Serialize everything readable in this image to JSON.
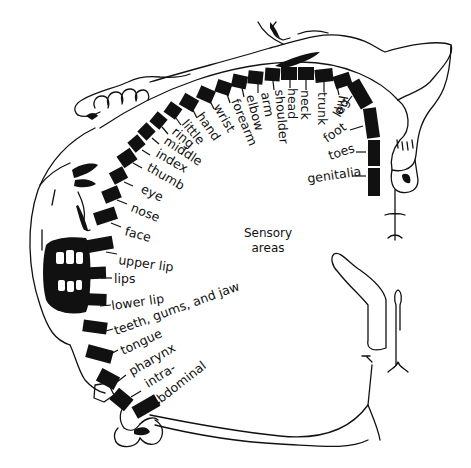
{
  "colors": {
    "ink": "#111111",
    "paper": "#ffffff"
  },
  "center_label": {
    "line1": "Sensory",
    "line2": "areas"
  },
  "regions": [
    {
      "label": "genitalia",
      "seg": [
        368,
        168,
        12,
        28,
        0
      ],
      "tick": [
        352,
        176,
        366,
        176
      ],
      "text": [
        308,
        183,
        -8
      ]
    },
    {
      "label": "toes",
      "seg": [
        368,
        140,
        12,
        26,
        0
      ],
      "tick": [
        356,
        152,
        366,
        152
      ],
      "text": [
        330,
        160,
        -18
      ]
    },
    {
      "label": "foot",
      "seg": [
        365,
        108,
        13,
        30,
        -8
      ],
      "tick": [
        350,
        130,
        363,
        126
      ],
      "text": [
        327,
        143,
        -35
      ]
    },
    {
      "label": "leg",
      "seg": [
        353,
        80,
        14,
        28,
        -30
      ],
      "tick": [
        346,
        104,
        352,
        96
      ],
      "text": [
        340,
        118,
        -60
      ]
    },
    {
      "label": "hip",
      "seg": [
        334,
        74,
        17,
        13,
        -18
      ],
      "tick": [
        337,
        86,
        339,
        95
      ],
      "text": [
        339,
        95,
        100
      ]
    },
    {
      "label": "trunk",
      "seg": [
        315,
        69,
        18,
        13,
        -6
      ],
      "tick": [
        324,
        82,
        324,
        92
      ],
      "text": [
        318,
        92,
        90
      ]
    },
    {
      "label": "neck",
      "seg": [
        298,
        67,
        16,
        13,
        0
      ],
      "tick": [
        306,
        80,
        306,
        90
      ],
      "text": [
        301,
        90,
        90
      ]
    },
    {
      "label": "head",
      "seg": [
        281,
        67,
        16,
        13,
        0
      ],
      "tick": [
        290,
        80,
        290,
        88
      ],
      "text": [
        288,
        88,
        90
      ]
    },
    {
      "label": "shoulder",
      "seg": [
        265,
        68,
        15,
        13,
        4
      ],
      "tick": [
        273,
        81,
        274,
        90
      ],
      "text": [
        275,
        90,
        85
      ]
    },
    {
      "label": "arm",
      "seg": [
        248,
        71,
        15,
        13,
        6
      ],
      "tick": [
        258,
        84,
        258,
        93
      ],
      "text": [
        261,
        93,
        80
      ]
    },
    {
      "label": "elbow",
      "seg": [
        232,
        75,
        15,
        13,
        12
      ],
      "tick": [
        242,
        88,
        244,
        97
      ],
      "text": [
        246,
        96,
        75
      ]
    },
    {
      "label": "forearm",
      "seg": [
        216,
        81,
        15,
        13,
        18
      ],
      "tick": [
        227,
        94,
        230,
        103
      ],
      "text": [
        231,
        101,
        68
      ]
    },
    {
      "label": "wrist",
      "seg": [
        198,
        88,
        16,
        13,
        24
      ],
      "tick": [
        210,
        101,
        214,
        109
      ],
      "text": [
        213,
        107,
        60
      ]
    },
    {
      "label": "hand",
      "seg": [
        181,
        96,
        16,
        13,
        30
      ],
      "tick": [
        193,
        110,
        197,
        118
      ],
      "text": [
        196,
        116,
        55
      ]
    },
    {
      "label": "little",
      "seg": [
        166,
        104,
        14,
        13,
        35
      ],
      "tick": [
        176,
        118,
        181,
        125
      ],
      "text": [
        181,
        124,
        50
      ]
    },
    {
      "label": "ring",
      "seg": [
        152,
        114,
        13,
        13,
        40
      ],
      "tick": [
        162,
        127,
        168,
        134
      ],
      "text": [
        171,
        133,
        40
      ]
    },
    {
      "label": "middle",
      "seg": [
        140,
        125,
        13,
        13,
        45
      ],
      "tick": [
        152,
        138,
        159,
        144
      ],
      "text": [
        163,
        143,
        33
      ]
    },
    {
      "label": "index",
      "seg": [
        130,
        137,
        13,
        13,
        50
      ],
      "tick": [
        142,
        150,
        150,
        155
      ],
      "text": [
        155,
        156,
        30
      ]
    },
    {
      "label": "thumb",
      "seg": [
        120,
        150,
        14,
        16,
        55
      ],
      "tick": [
        133,
        163,
        142,
        168
      ],
      "text": [
        146,
        170,
        30
      ]
    },
    {
      "label": "eye",
      "seg": [
        112,
        168,
        13,
        15,
        62
      ],
      "tick": [
        124,
        182,
        133,
        186
      ],
      "text": [
        140,
        192,
        25
      ]
    },
    {
      "label": "nose",
      "seg": [
        105,
        186,
        13,
        17,
        68
      ],
      "tick": [
        117,
        200,
        127,
        204
      ],
      "text": [
        130,
        211,
        22
      ]
    },
    {
      "label": "face",
      "seg": [
        99,
        205,
        13,
        22,
        72
      ],
      "tick": [
        111,
        223,
        121,
        227
      ],
      "text": [
        124,
        235,
        15
      ]
    },
    {
      "label": "upper lip",
      "seg": [
        93,
        231,
        13,
        27,
        80
      ],
      "tick": [
        106,
        252,
        117,
        254
      ],
      "text": [
        118,
        264,
        8
      ]
    },
    {
      "label": "lips",
      "seg": [
        89,
        262,
        12,
        22,
        88
      ],
      "tick": [
        101,
        278,
        112,
        278
      ],
      "text": [
        114,
        283,
        0
      ]
    },
    {
      "label": "lower lip",
      "seg": [
        88,
        287,
        12,
        25,
        92
      ],
      "tick": [
        100,
        306,
        111,
        305
      ],
      "text": [
        112,
        310,
        -8
      ]
    },
    {
      "label": "teeth, gums, and jaw",
      "seg": [
        89,
        315,
        12,
        24,
        98
      ],
      "tick": [
        102,
        332,
        113,
        329
      ],
      "text": [
        116,
        335,
        -20
      ]
    },
    {
      "label": "tongue",
      "seg": [
        93,
        341,
        13,
        26,
        105
      ],
      "tick": [
        107,
        356,
        118,
        350
      ],
      "text": [
        123,
        355,
        -25
      ]
    },
    {
      "label": "pharynx",
      "seg": [
        101,
        369,
        14,
        20,
        118
      ],
      "tick": [
        117,
        382,
        126,
        375
      ],
      "text": [
        132,
        376,
        -30
      ]
    },
    {
      "label": "intra-",
      "seg": [
        114,
        390,
        15,
        19,
        130
      ],
      "tick": [
        131,
        397,
        141,
        391
      ],
      "text": [
        148,
        388,
        -32
      ]
    },
    {
      "label": "abdominal",
      "seg": [
        133,
        400,
        26,
        13,
        150
      ],
      "tick": [
        155,
        405,
        160,
        402
      ],
      "text": [
        155,
        408,
        -38
      ]
    }
  ]
}
